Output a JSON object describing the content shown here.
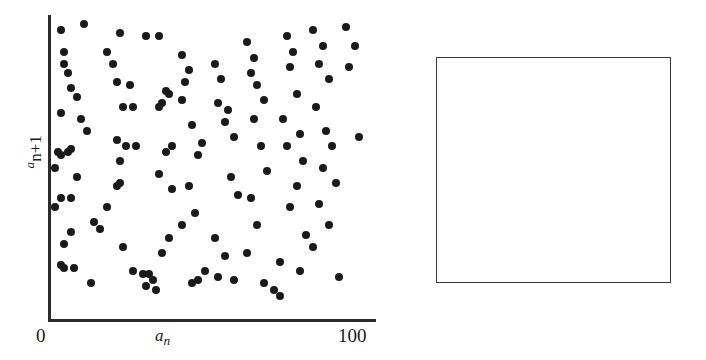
{
  "figure": {
    "panels": [
      "scatter-plot",
      "digit-grid"
    ]
  },
  "scatter": {
    "xlabel_base": "a",
    "xlabel_sub": "n",
    "ylabel_sup": "a",
    "ylabel_rest": "n+1",
    "x_tick_min": "0",
    "x_tick_max": "100",
    "axis_color": "#2b2b2b",
    "point_color": "#1a1a1a"
  },
  "chart_data": {
    "type": "scatter",
    "title": "",
    "xlabel": "a_n",
    "ylabel": "a_n+1",
    "xlim": [
      0,
      100
    ],
    "ylim": [
      0,
      100
    ],
    "grid": false,
    "legend": "none",
    "xticks": [
      0,
      100
    ],
    "yticks": [],
    "n_points": 128,
    "points": [
      [
        4,
        95
      ],
      [
        11,
        97
      ],
      [
        18,
        88
      ],
      [
        22,
        94
      ],
      [
        30,
        93
      ],
      [
        5,
        88
      ],
      [
        5,
        84
      ],
      [
        6,
        81
      ],
      [
        7,
        76
      ],
      [
        9,
        73
      ],
      [
        4,
        68
      ],
      [
        3,
        55
      ],
      [
        4,
        54
      ],
      [
        6,
        55
      ],
      [
        7,
        56
      ],
      [
        2,
        50
      ],
      [
        4,
        40
      ],
      [
        7,
        40
      ],
      [
        2,
        37
      ],
      [
        7,
        29
      ],
      [
        5,
        25
      ],
      [
        4,
        18
      ],
      [
        5,
        17
      ],
      [
        8,
        17
      ],
      [
        13,
        12
      ],
      [
        10,
        66
      ],
      [
        12,
        62
      ],
      [
        9,
        47
      ],
      [
        14,
        32
      ],
      [
        16,
        30
      ],
      [
        20,
        84
      ],
      [
        21,
        78
      ],
      [
        25,
        77
      ],
      [
        23,
        70
      ],
      [
        26,
        70
      ],
      [
        21,
        59
      ],
      [
        24,
        57
      ],
      [
        27,
        57
      ],
      [
        22,
        52
      ],
      [
        22,
        45
      ],
      [
        21,
        44
      ],
      [
        18,
        37
      ],
      [
        23,
        24
      ],
      [
        26,
        16
      ],
      [
        29,
        15
      ],
      [
        31,
        15
      ],
      [
        30,
        11
      ],
      [
        33,
        10
      ],
      [
        32,
        13
      ],
      [
        34,
        93
      ],
      [
        36,
        75
      ],
      [
        37,
        74
      ],
      [
        35,
        71
      ],
      [
        34,
        70
      ],
      [
        38,
        57
      ],
      [
        36,
        55
      ],
      [
        34,
        48
      ],
      [
        38,
        43
      ],
      [
        37,
        27
      ],
      [
        35,
        22
      ],
      [
        41,
        87
      ],
      [
        43,
        82
      ],
      [
        42,
        78
      ],
      [
        41,
        72
      ],
      [
        44,
        64
      ],
      [
        47,
        58
      ],
      [
        46,
        54
      ],
      [
        43,
        44
      ],
      [
        45,
        35
      ],
      [
        41,
        31
      ],
      [
        48,
        16
      ],
      [
        46,
        13
      ],
      [
        44,
        12
      ],
      [
        51,
        84
      ],
      [
        53,
        79
      ],
      [
        52,
        71
      ],
      [
        55,
        69
      ],
      [
        54,
        65
      ],
      [
        57,
        60
      ],
      [
        56,
        47
      ],
      [
        58,
        41
      ],
      [
        51,
        27
      ],
      [
        54,
        21
      ],
      [
        52,
        14
      ],
      [
        57,
        13
      ],
      [
        61,
        91
      ],
      [
        63,
        86
      ],
      [
        62,
        81
      ],
      [
        64,
        77
      ],
      [
        66,
        72
      ],
      [
        63,
        66
      ],
      [
        65,
        57
      ],
      [
        67,
        49
      ],
      [
        62,
        40
      ],
      [
        64,
        31
      ],
      [
        61,
        22
      ],
      [
        66,
        12
      ],
      [
        69,
        10
      ],
      [
        71,
        8
      ],
      [
        73,
        93
      ],
      [
        75,
        88
      ],
      [
        74,
        83
      ],
      [
        76,
        74
      ],
      [
        72,
        66
      ],
      [
        77,
        61
      ],
      [
        73,
        57
      ],
      [
        78,
        52
      ],
      [
        76,
        44
      ],
      [
        74,
        37
      ],
      [
        79,
        28
      ],
      [
        71,
        19
      ],
      [
        77,
        16
      ],
      [
        81,
        95
      ],
      [
        84,
        90
      ],
      [
        83,
        84
      ],
      [
        86,
        79
      ],
      [
        82,
        70
      ],
      [
        85,
        62
      ],
      [
        87,
        57
      ],
      [
        84,
        50
      ],
      [
        88,
        45
      ],
      [
        83,
        38
      ],
      [
        86,
        31
      ],
      [
        81,
        24
      ],
      [
        89,
        14
      ],
      [
        91,
        96
      ],
      [
        94,
        90
      ],
      [
        92,
        83
      ],
      [
        95,
        60
      ]
    ]
  },
  "grid": {
    "rows": 10,
    "cols": 10,
    "box": {
      "row_start": 1,
      "row_end": 8,
      "col_start": 1,
      "col_end": 8
    },
    "values": [
      [
        "3",
        "0",
        "2",
        "1",
        "0",
        "2",
        "0",
        "2",
        "2",
        "1"
      ],
      [
        "3",
        "0",
        "2",
        "1",
        "0",
        "1",
        "2",
        "2",
        "3",
        "0"
      ],
      [
        "2",
        "1",
        "1",
        "1",
        "3",
        "1",
        "1",
        "1",
        "0",
        "0"
      ],
      [
        "1",
        "1",
        "0",
        "3",
        "0",
        "0",
        "1",
        "2",
        "0",
        "3"
      ],
      [
        "1",
        "1",
        "1",
        "2",
        "1",
        "1",
        "0",
        "0",
        "1",
        "2"
      ],
      [
        "2",
        "1",
        "1",
        "2",
        "1",
        "0",
        "3",
        "1",
        "2",
        "1"
      ],
      [
        "3",
        "0",
        "1",
        "1",
        "0",
        "0",
        "2",
        "1",
        "3",
        "2"
      ],
      [
        "1",
        "2",
        "0",
        "1",
        "2",
        "1",
        "0",
        "0",
        "1",
        "1"
      ],
      [
        "2",
        "0",
        "0",
        "1",
        "1",
        "1",
        "0",
        "1",
        "1",
        "0"
      ],
      [
        "2",
        "1",
        "1",
        "2",
        "3",
        "2",
        "3",
        "1",
        "1",
        "1"
      ]
    ],
    "box_border_color": "#3a3a3a"
  }
}
